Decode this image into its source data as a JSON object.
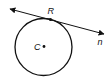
{
  "diagram": {
    "circle": {
      "center_label": "C"
    },
    "tangent_point": {
      "label": "R"
    },
    "line": {
      "label": "n",
      "arrows": "both-ends"
    },
    "colors": {
      "stroke": "#111111",
      "background": "#ffffff"
    }
  }
}
